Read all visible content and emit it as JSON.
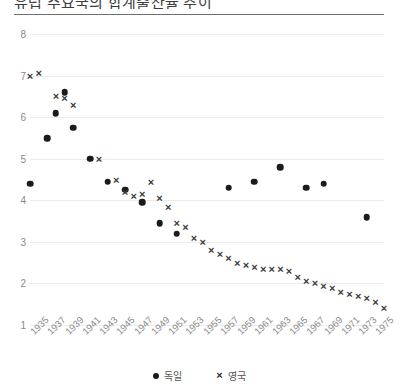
{
  "chart_title": "유럽 주요국의 합계출산율 추이",
  "legend": {
    "position": "bottom-center",
    "entries": [
      {
        "label": "독일",
        "marker": "dot",
        "color": "#1b1b1b"
      },
      {
        "label": "영국",
        "marker": "cross",
        "color": "#2f2f2f"
      }
    ]
  },
  "chart_data": {
    "type": "scatter",
    "title": "유럽 주요국의 합계출산율 추이",
    "xlabel": "",
    "ylabel": "",
    "xlim": [
      1935,
      1975
    ],
    "ylim": [
      1,
      8
    ],
    "grid": true,
    "ytick_labels": [
      "8",
      "7",
      "6",
      "5",
      "4",
      "3",
      "2",
      "1"
    ],
    "yticks": [
      8,
      7,
      6,
      5,
      4,
      3,
      2,
      1
    ],
    "xtick_labels": [
      "1935",
      "1937",
      "1939",
      "1941",
      "1943",
      "1945",
      "1947",
      "1949",
      "1951",
      "1953",
      "1955",
      "1957",
      "1959",
      "1961",
      "1963",
      "1965",
      "1967",
      "1969",
      "1971",
      "1973",
      "1975"
    ],
    "xticks": [
      1935,
      1937,
      1939,
      1941,
      1943,
      1945,
      1947,
      1949,
      1951,
      1953,
      1955,
      1957,
      1959,
      1961,
      1963,
      1965,
      1967,
      1969,
      1971,
      1973,
      1975
    ],
    "series": [
      {
        "name": "독일",
        "marker": "dot",
        "color": "#1b1b1b",
        "points": [
          {
            "x": 1935,
            "y": 4.4
          },
          {
            "x": 1937,
            "y": 5.5
          },
          {
            "x": 1938,
            "y": 6.1
          },
          {
            "x": 1939,
            "y": 6.6
          },
          {
            "x": 1940,
            "y": 5.75
          },
          {
            "x": 1942,
            "y": 5.0
          },
          {
            "x": 1944,
            "y": 4.45
          },
          {
            "x": 1946,
            "y": 4.25
          },
          {
            "x": 1948,
            "y": 3.95
          },
          {
            "x": 1950,
            "y": 3.45
          },
          {
            "x": 1952,
            "y": 3.2
          },
          {
            "x": 1958,
            "y": 4.3
          },
          {
            "x": 1961,
            "y": 4.45
          },
          {
            "x": 1964,
            "y": 4.8
          },
          {
            "x": 1967,
            "y": 4.3
          },
          {
            "x": 1969,
            "y": 4.4
          },
          {
            "x": 1974,
            "y": 3.6
          }
        ]
      },
      {
        "name": "영국",
        "marker": "cross",
        "color": "#2f2f2f",
        "points": [
          {
            "x": 1935,
            "y": 7.0
          },
          {
            "x": 1936,
            "y": 7.05
          },
          {
            "x": 1938,
            "y": 6.5
          },
          {
            "x": 1939,
            "y": 6.45
          },
          {
            "x": 1940,
            "y": 6.3
          },
          {
            "x": 1943,
            "y": 5.0
          },
          {
            "x": 1945,
            "y": 4.5
          },
          {
            "x": 1946,
            "y": 4.2
          },
          {
            "x": 1947,
            "y": 4.1
          },
          {
            "x": 1948,
            "y": 4.15
          },
          {
            "x": 1949,
            "y": 4.45
          },
          {
            "x": 1950,
            "y": 4.05
          },
          {
            "x": 1951,
            "y": 3.85
          },
          {
            "x": 1952,
            "y": 3.45
          },
          {
            "x": 1953,
            "y": 3.35
          },
          {
            "x": 1954,
            "y": 3.1
          },
          {
            "x": 1955,
            "y": 3.0
          },
          {
            "x": 1956,
            "y": 2.8
          },
          {
            "x": 1957,
            "y": 2.7
          },
          {
            "x": 1958,
            "y": 2.6
          },
          {
            "x": 1959,
            "y": 2.5
          },
          {
            "x": 1960,
            "y": 2.45
          },
          {
            "x": 1961,
            "y": 2.4
          },
          {
            "x": 1962,
            "y": 2.35
          },
          {
            "x": 1963,
            "y": 2.35
          },
          {
            "x": 1964,
            "y": 2.35
          },
          {
            "x": 1965,
            "y": 2.3
          },
          {
            "x": 1966,
            "y": 2.15
          },
          {
            "x": 1967,
            "y": 2.05
          },
          {
            "x": 1968,
            "y": 2.0
          },
          {
            "x": 1969,
            "y": 1.95
          },
          {
            "x": 1970,
            "y": 1.9
          },
          {
            "x": 1971,
            "y": 1.8
          },
          {
            "x": 1972,
            "y": 1.75
          },
          {
            "x": 1973,
            "y": 1.7
          },
          {
            "x": 1974,
            "y": 1.65
          },
          {
            "x": 1975,
            "y": 1.55
          },
          {
            "x": 1976,
            "y": 1.4
          }
        ]
      }
    ]
  }
}
